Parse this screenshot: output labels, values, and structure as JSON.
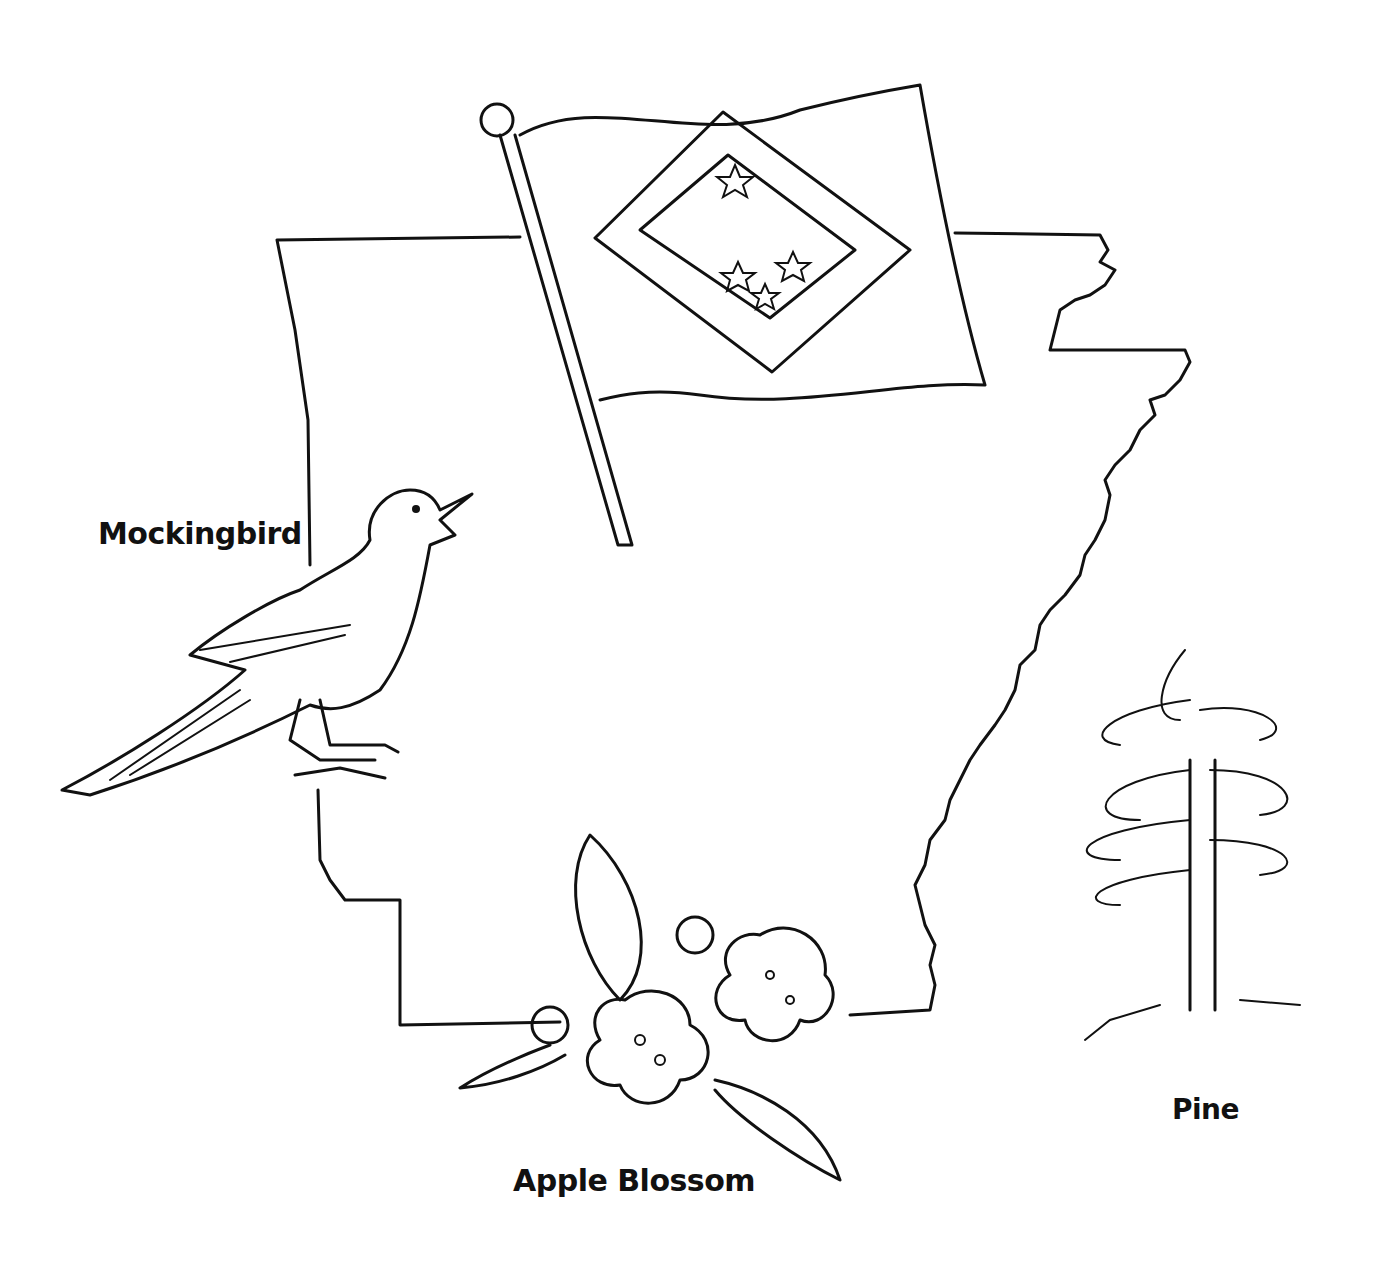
{
  "illustration": {
    "subject": "Arkansas state symbols coloring page",
    "labels": {
      "bird": "Mockingbird",
      "flower": "Apple Blossom",
      "tree": "Pine"
    },
    "colors": {
      "ink": "#111111",
      "paper": "#ffffff"
    }
  }
}
